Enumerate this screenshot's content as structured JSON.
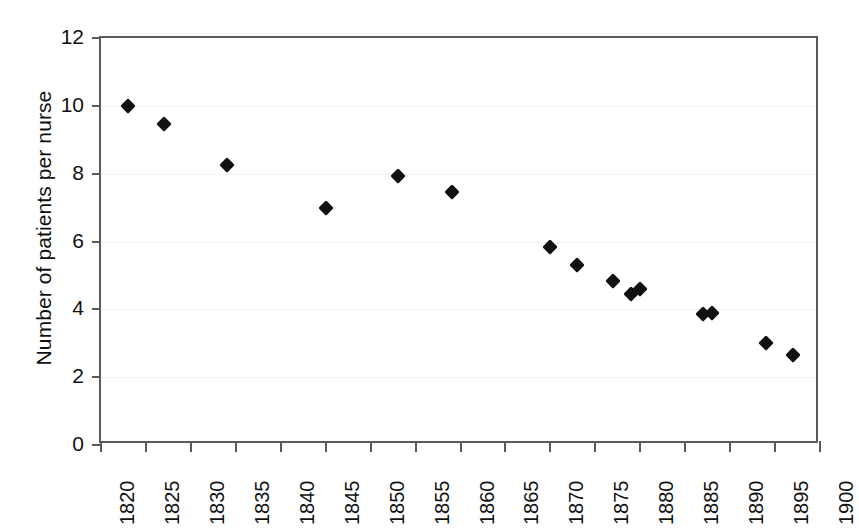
{
  "chart_data": {
    "type": "scatter",
    "title": "",
    "xlabel": "",
    "ylabel": "Number of patients per nurse",
    "xlim": [
      1820,
      1900
    ],
    "ylim": [
      0,
      12
    ],
    "xticks": [
      1820,
      1825,
      1830,
      1835,
      1840,
      1845,
      1850,
      1855,
      1860,
      1865,
      1870,
      1875,
      1880,
      1885,
      1890,
      1895,
      1900
    ],
    "xtick_labels": [
      "1820",
      "1825",
      "1830",
      "1835",
      "1840",
      "1845",
      "1850",
      "1855",
      "1860",
      "1865",
      "1870",
      "1875",
      "1880",
      "1885",
      "1890",
      "1895",
      "1900"
    ],
    "yticks": [
      0,
      2,
      4,
      6,
      8,
      10,
      12
    ],
    "ytick_labels": [
      "0",
      "2",
      "4",
      "6",
      "8",
      "10",
      "12"
    ],
    "grid": true,
    "grid_axis": "y",
    "legend": false,
    "marker": "diamond",
    "marker_color": "#111111",
    "axis_color": "#5a5a5a",
    "grid_color": "#f2f2f2",
    "background": "#ffffff",
    "x": [
      1823,
      1827,
      1834,
      1845,
      1853,
      1859,
      1870,
      1873,
      1877,
      1879,
      1880,
      1887,
      1888,
      1894,
      1897
    ],
    "y": [
      10.0,
      9.45,
      8.25,
      7.0,
      7.93,
      7.45,
      5.85,
      5.3,
      4.85,
      4.45,
      4.6,
      3.85,
      3.9,
      3.0,
      2.65
    ],
    "points": [
      {
        "x": 1823,
        "y": 10.0
      },
      {
        "x": 1827,
        "y": 9.45
      },
      {
        "x": 1834,
        "y": 8.25
      },
      {
        "x": 1845,
        "y": 7.0
      },
      {
        "x": 1853,
        "y": 7.93
      },
      {
        "x": 1859,
        "y": 7.45
      },
      {
        "x": 1870,
        "y": 5.85
      },
      {
        "x": 1873,
        "y": 5.3
      },
      {
        "x": 1877,
        "y": 4.85
      },
      {
        "x": 1879,
        "y": 4.45
      },
      {
        "x": 1880,
        "y": 4.6
      },
      {
        "x": 1887,
        "y": 3.85
      },
      {
        "x": 1888,
        "y": 3.9
      },
      {
        "x": 1894,
        "y": 3.0
      },
      {
        "x": 1897,
        "y": 2.65
      }
    ]
  }
}
